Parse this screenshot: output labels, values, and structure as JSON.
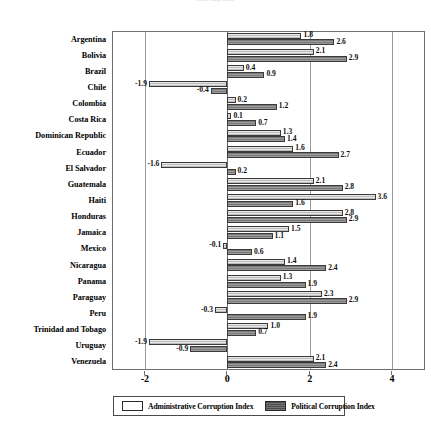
{
  "chart_data": {
    "type": "bar",
    "orientation": "horizontal",
    "title": "Corruption",
    "xlabel": "",
    "ylabel": "",
    "xlim": [
      -2.8,
      4.8
    ],
    "xticks": [
      -2,
      0,
      2,
      4
    ],
    "xticklabels": [
      "-2",
      "0",
      "2",
      "4"
    ],
    "grid": true,
    "legend_position": "bottom",
    "categories": [
      "Argentina",
      "Bolivia",
      "Brazil",
      "Chile",
      "Colombia",
      "Costa Rica",
      "Dominican Republic",
      "Ecuador",
      "El Salvador",
      "Guatemala",
      "Haiti",
      "Honduras",
      "Jamaica",
      "Mexico",
      "Nicaragua",
      "Panama",
      "Paraguay",
      "Peru",
      "Trinidad and Tobago",
      "Uruguay",
      "Venezuela"
    ],
    "series": [
      {
        "name": "Administrative Corruption Index",
        "key": "admin",
        "color": "#d8d8d8",
        "values": [
          1.8,
          2.1,
          0.4,
          -1.9,
          0.2,
          0.1,
          1.3,
          1.6,
          -1.6,
          2.1,
          3.6,
          2.8,
          1.5,
          -0.1,
          1.4,
          1.3,
          2.3,
          -0.3,
          1.0,
          -1.9,
          2.1
        ],
        "labels": [
          "1.8",
          "2.1",
          "0.4",
          "-1.9",
          "0.2",
          "0.1",
          "1.3",
          "1.6",
          "-1.6",
          "2.1",
          "3.6",
          "2.8",
          "1.5",
          "-0.1",
          "1.4",
          "1.3",
          "2.3",
          "-0.3",
          "1.0",
          "-1.9",
          "2.1"
        ]
      },
      {
        "name": "Political Corruption Index",
        "key": "political",
        "color": "#8a8a8a",
        "values": [
          2.6,
          2.9,
          0.9,
          -0.4,
          1.2,
          0.7,
          1.4,
          2.7,
          0.2,
          2.8,
          1.6,
          2.9,
          1.1,
          0.6,
          2.4,
          1.9,
          2.9,
          1.9,
          0.7,
          -0.9,
          2.4
        ],
        "labels": [
          "2.6",
          "2.9",
          "0.9",
          "-0.4",
          "1.2",
          "0.7",
          "1.4",
          "2.7",
          "0.2",
          "2.8",
          "1.6",
          "2.9",
          "1.1",
          "0.6",
          "2.4",
          "1.9",
          "2.9",
          "1.9",
          "0.7",
          "-0.9",
          "2.4"
        ]
      }
    ]
  },
  "legend": {
    "items": [
      {
        "label": "Administrative Corruption Index",
        "key": "admin"
      },
      {
        "label": "Political Corruption Index",
        "key": "political"
      }
    ]
  }
}
